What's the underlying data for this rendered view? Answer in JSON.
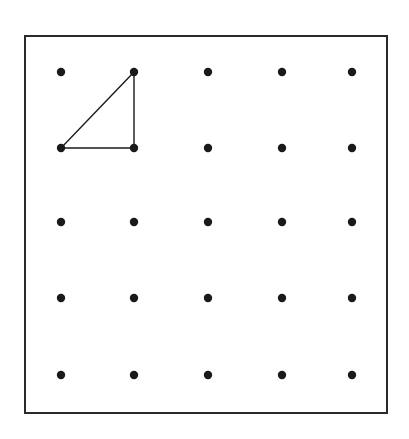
{
  "diagram": {
    "title": "",
    "type": "geoboard dot grid",
    "frame": {
      "x": 25,
      "y": 36,
      "width": 362,
      "height": 377,
      "stroke": "#2a2a2a",
      "stroke_width": 2
    },
    "grid": {
      "rows": 5,
      "cols": 5,
      "xs": [
        61,
        134,
        208,
        282,
        352
      ],
      "ys": [
        72,
        148,
        222,
        298,
        375
      ],
      "dot_radius": 4.2,
      "dot_color": "#1a1a1a"
    },
    "shapes": [
      {
        "name": "right-triangle",
        "vertices_grid": [
          [
            1,
            0
          ],
          [
            0,
            1
          ],
          [
            1,
            1
          ]
        ],
        "stroke": "#1a1a1a",
        "stroke_width": 1.4
      }
    ]
  }
}
